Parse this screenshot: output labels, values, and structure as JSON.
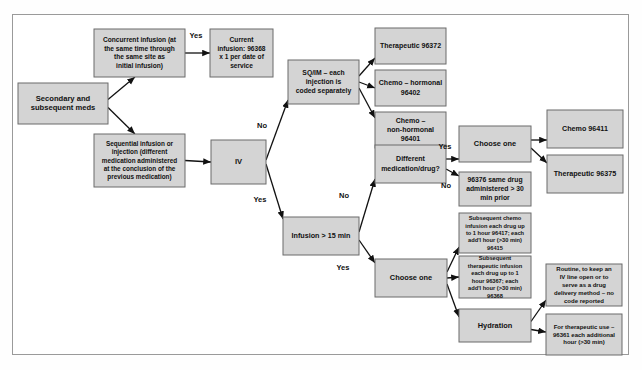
{
  "diagram": {
    "colors": {
      "node_fill": "#d4d4d4",
      "node_stroke": "#6b6b6b",
      "edge": "#111111",
      "frame": "#9a9a9a",
      "page_background": "#ffffff"
    },
    "nodes": [
      {
        "id": "start",
        "label": "Secondary and subsequent meds",
        "x": 18,
        "y": 83,
        "w": 90,
        "h": 41,
        "font": 7.6
      },
      {
        "id": "concurrent",
        "label": "Concurrent infusion (at the same time through the same site as initial infusion)",
        "x": 94,
        "y": 29,
        "w": 91,
        "h": 48,
        "font": 6.6
      },
      {
        "id": "current_infusion",
        "label": "Current infusion: 96368 x 1 per date of service",
        "x": 210,
        "y": 29,
        "w": 63,
        "h": 48,
        "font": 6.6
      },
      {
        "id": "sequential",
        "label": "Sequential infusion or injection (different medication administered at the conclusion of the previous medication)",
        "x": 94,
        "y": 134,
        "w": 91,
        "h": 53,
        "font": 6.4
      },
      {
        "id": "iv",
        "label": "IV",
        "x": 211,
        "y": 140,
        "w": 55,
        "h": 44,
        "font": 7.6
      },
      {
        "id": "sqim",
        "label": "SQ/IM – each injection is coded separately",
        "x": 288,
        "y": 60,
        "w": 71,
        "h": 44,
        "font": 6.8
      },
      {
        "id": "therapeutic_96372",
        "label": "Therapeutic 96372",
        "x": 375,
        "y": 28,
        "w": 71,
        "h": 36,
        "font": 7.0
      },
      {
        "id": "chemo_96402",
        "label": "Chemo – hormonal 96402",
        "x": 375,
        "y": 70,
        "w": 71,
        "h": 36,
        "font": 7.0
      },
      {
        "id": "chemo_96401",
        "label": "Chemo – non-hormonal 96401",
        "x": 375,
        "y": 112,
        "w": 71,
        "h": 36,
        "font": 7.0
      },
      {
        "id": "different_med",
        "label": "Different medication/drug?",
        "x": 375,
        "y": 145,
        "w": 71,
        "h": 38,
        "font": 7.0
      },
      {
        "id": "choose_one_top",
        "label": "Choose one",
        "x": 459,
        "y": 126,
        "w": 72,
        "h": 36,
        "font": 7.4
      },
      {
        "id": "same_drug_96376",
        "label": "96376 same drug administered > 30 min prior",
        "x": 459,
        "y": 172,
        "w": 72,
        "h": 34,
        "font": 6.8
      },
      {
        "id": "chemo_96411",
        "label": "Chemo 96411",
        "x": 547,
        "y": 110,
        "w": 76,
        "h": 38,
        "font": 7.2
      },
      {
        "id": "therapeutic_96375",
        "label": "Therapeutic 96375",
        "x": 547,
        "y": 155,
        "w": 76,
        "h": 38,
        "font": 7.2
      },
      {
        "id": "infusion_15",
        "label": "Infusion > 15 min",
        "x": 283,
        "y": 217,
        "w": 76,
        "h": 38,
        "font": 7.2
      },
      {
        "id": "subseq_chemo",
        "label": "Subsequent chemo infusion each drug up to 1 hour 96417; each add'l hour (>30 min) 96415",
        "x": 459,
        "y": 213,
        "w": 72,
        "h": 40,
        "font": 5.7
      },
      {
        "id": "choose_one_bot",
        "label": "Choose one",
        "x": 375,
        "y": 259,
        "w": 72,
        "h": 38,
        "font": 7.4
      },
      {
        "id": "subseq_therap",
        "label": "Subsequent therapeutic infusion each drug up to 1 hour 96367; each add'l hour (>30 min) 96368",
        "x": 459,
        "y": 256,
        "w": 72,
        "h": 42,
        "font": 5.7
      },
      {
        "id": "hydration",
        "label": "Hydration",
        "x": 459,
        "y": 309,
        "w": 72,
        "h": 33,
        "font": 7.4
      },
      {
        "id": "routine_iv",
        "label": "Routine, to keep an IV line open or to serve as a drug delivery method – no code reported",
        "x": 546,
        "y": 264,
        "w": 76,
        "h": 42,
        "font": 6.0
      },
      {
        "id": "therap_96361",
        "label": "For therapeutic use – 96361 each additional hour (>30 min)",
        "x": 546,
        "y": 314,
        "w": 76,
        "h": 41,
        "font": 6.0
      }
    ],
    "edge_labels": [
      {
        "id": "concurrent-yes",
        "text": "Yes",
        "x": 196,
        "y": 36
      },
      {
        "id": "iv-no",
        "text": "No",
        "x": 262,
        "y": 126
      },
      {
        "id": "iv-yes",
        "text": "Yes",
        "x": 260,
        "y": 200
      },
      {
        "id": "different-yes",
        "text": "Yes",
        "x": 445,
        "y": 147
      },
      {
        "id": "different-no",
        "text": "No",
        "x": 446,
        "y": 186
      },
      {
        "id": "infusion-no",
        "text": "No",
        "x": 344,
        "y": 196
      },
      {
        "id": "infusion-yes",
        "text": "Yes",
        "x": 343,
        "y": 268
      }
    ]
  }
}
